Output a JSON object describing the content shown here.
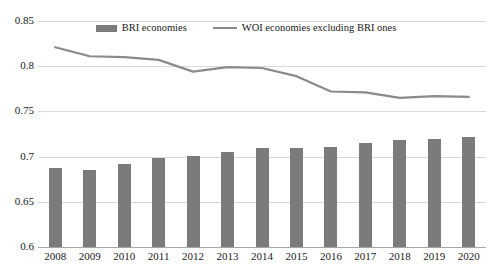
{
  "legend": {
    "position": "top-center",
    "entries": [
      {
        "label": "BRI economies",
        "marker": "bar-swatch-icon",
        "color": "#7b7b7b"
      },
      {
        "label": "WOI economies excluding BRI ones",
        "marker": "line-swatch-icon",
        "color": "#8a8a8a"
      }
    ]
  },
  "chart_data": {
    "type": "bar",
    "title": "",
    "subtitle": "",
    "xlabel": "",
    "ylabel": "",
    "ylim": [
      0.6,
      0.85
    ],
    "yticks": [
      "0.6",
      "0.65",
      "0.7",
      "0.75",
      "0.8",
      "0.85"
    ],
    "ytick_values": [
      0.6,
      0.65,
      0.7,
      0.75,
      0.8,
      0.85
    ],
    "grid": true,
    "legend_position": "top-center",
    "categories": [
      "2008",
      "2009",
      "2010",
      "2011",
      "2012",
      "2013",
      "2014",
      "2015",
      "2016",
      "2017",
      "2018",
      "2019",
      "2020"
    ],
    "series": [
      {
        "name": "BRI economies",
        "type": "bar",
        "color": "#7b7b7b",
        "values": [
          0.687,
          0.685,
          0.692,
          0.698,
          0.701,
          0.705,
          0.709,
          0.71,
          0.711,
          0.715,
          0.718,
          0.719,
          0.722
        ]
      },
      {
        "name": "WOI economies excluding BRI ones",
        "type": "line",
        "color": "#8a8a8a",
        "values": [
          0.821,
          0.811,
          0.81,
          0.807,
          0.794,
          0.799,
          0.798,
          0.789,
          0.772,
          0.771,
          0.765,
          0.767,
          0.766
        ]
      }
    ]
  }
}
